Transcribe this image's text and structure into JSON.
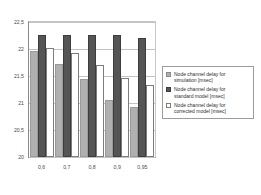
{
  "chart_data": {
    "type": "bar",
    "title": "",
    "xlabel": "",
    "ylabel": "",
    "categories": [
      "0,6",
      "0,7",
      "0,8",
      "0,9",
      "0,95"
    ],
    "series": [
      {
        "name": "Node channel delay for simulation [msec]",
        "legend_key": "simulation",
        "color": "#b0b0b0",
        "values": [
          21.97,
          21.72,
          21.44,
          21.05,
          20.93
        ]
      },
      {
        "name": "Node channel delay for standard model [msec]",
        "legend_key": "standard",
        "color": "#555555",
        "values": [
          22.26,
          22.26,
          22.26,
          22.26,
          22.2
        ]
      },
      {
        "name": "Node channel delay for corrected model [msec]",
        "legend_key": "corrected",
        "color": "#ffffff",
        "values": [
          22.02,
          21.93,
          21.71,
          21.46,
          21.33
        ]
      }
    ],
    "ylim": [
      20,
      22.5
    ],
    "yticks": [
      20,
      20.5,
      21,
      21.5,
      22,
      22.5
    ],
    "ytick_labels": [
      "20",
      "20,5",
      "21",
      "21,5",
      "22",
      "22,5"
    ],
    "grid": true,
    "legend_position": "right"
  },
  "legend": {
    "entries": [
      {
        "label": "Node channel delay for\nsimulation [msec]"
      },
      {
        "label": "Node channel delay for\nstandard model [msec]"
      },
      {
        "label": "Node channel delay for\ncorrected model [msec]"
      }
    ]
  }
}
